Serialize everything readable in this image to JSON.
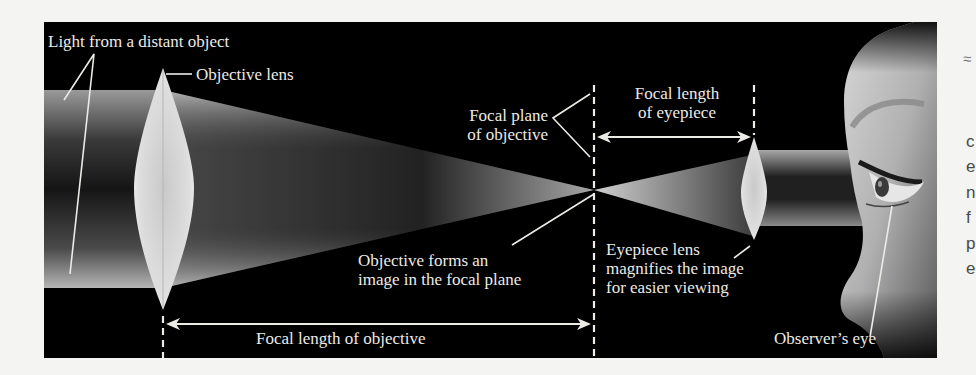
{
  "diagram": {
    "labels": {
      "light_source": "Light from a distant object",
      "objective_lens": "Objective lens",
      "focal_plane_line1": "Focal plane",
      "focal_plane_line2": "of objective",
      "focal_length_eyepiece_line1": "Focal length",
      "focal_length_eyepiece_line2": "of eyepiece",
      "objective_forms_line1": "Objective forms an",
      "objective_forms_line2": "image in the focal plane",
      "eyepiece_line1": "Eyepiece lens",
      "eyepiece_line2": "magnifies the image",
      "eyepiece_line3": "for easier viewing",
      "focal_length_objective": "Focal length of objective",
      "observers_eye": "Observer’s eye"
    },
    "colors": {
      "background": "#000000",
      "label": "#ecebe6",
      "beam": "#c8c8c8",
      "lens": "#d9d9d9",
      "skin": "#bdbdbd"
    }
  },
  "page_margin": {
    "glyph": "≈",
    "fragments": [
      "c",
      "e",
      "n",
      "f",
      "p",
      "e"
    ]
  }
}
